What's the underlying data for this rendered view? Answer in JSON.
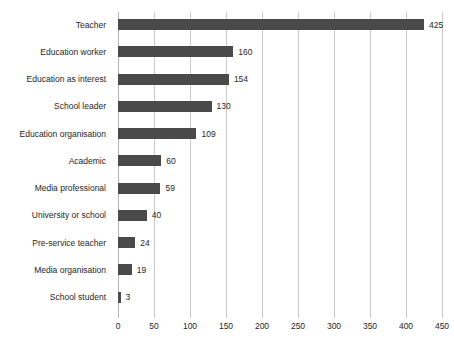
{
  "chart_data": {
    "type": "bar",
    "orientation": "horizontal",
    "title": "",
    "subtitle": "",
    "xlabel": "",
    "ylabel": "",
    "xlim": [
      0,
      450
    ],
    "xticks": [
      0,
      50,
      100,
      150,
      200,
      250,
      300,
      350,
      400,
      450
    ],
    "xtick_labels": [
      "0",
      "50",
      "100",
      "150",
      "200",
      "250",
      "300",
      "350",
      "400",
      "450"
    ],
    "grid": true,
    "grid_axis": "x",
    "legend": false,
    "legend_position": "none",
    "data_labels": true,
    "categories": [
      "Teacher",
      "Education worker",
      "Education as interest",
      "School leader",
      "Education organisation",
      "Academic",
      "Media professional",
      "University or school",
      "Pre-service teacher",
      "Media organisation",
      "School student"
    ],
    "values": [
      425,
      160,
      154,
      130,
      109,
      60,
      59,
      40,
      24,
      19,
      3
    ],
    "value_labels": [
      "425",
      "160",
      "154",
      "130",
      "109",
      "60",
      "59",
      "40",
      "24",
      "19",
      "3"
    ],
    "bar_color": "#4a4a4a",
    "grid_color": "#c9c9c9",
    "background_color": "#ffffff",
    "text_color": "#262626"
  }
}
